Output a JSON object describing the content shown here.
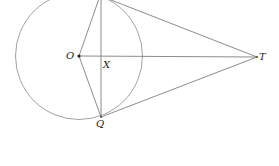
{
  "diagram": {
    "colors": {
      "stroke": "#7a7a7a",
      "point": "#222222",
      "background": "#ffffff"
    },
    "circle": {
      "center": "O",
      "cx": 79,
      "cy": 56,
      "r": 63.5
    },
    "points": {
      "O": {
        "x": 79,
        "y": 56
      },
      "P": {
        "x": 101,
        "y": -7
      },
      "Q": {
        "x": 101,
        "y": 117
      },
      "T": {
        "x": 257,
        "y": 57
      },
      "X": {
        "x": 101,
        "y": 56
      }
    },
    "segments": [
      [
        "O",
        "T"
      ],
      [
        "P",
        "Q"
      ],
      [
        "O",
        "P"
      ],
      [
        "O",
        "Q"
      ],
      [
        "P",
        "T"
      ],
      [
        "Q",
        "T"
      ]
    ],
    "labels": {
      "O": "O",
      "X": "X",
      "Q": "Q",
      "T": "T"
    }
  }
}
